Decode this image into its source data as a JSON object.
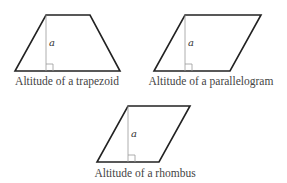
{
  "figures": [
    {
      "name": "trapezoid",
      "caption": "Altitude of a trapezoid",
      "altitude_label": "a",
      "vertices": [
        [
          46,
          15
        ],
        [
          90,
          15
        ],
        [
          120,
          71
        ],
        [
          15,
          71
        ]
      ],
      "altitude": {
        "x": 46,
        "y1": 15,
        "y2": 71
      },
      "label_pos": [
        49,
        46
      ],
      "caption_pos": [
        67,
        85
      ]
    },
    {
      "name": "parallelogram",
      "caption": "Altitude of a parallelogram",
      "altitude_label": "a",
      "vertices": [
        [
          185,
          15
        ],
        [
          261,
          15
        ],
        [
          230,
          71
        ],
        [
          154,
          71
        ]
      ],
      "altitude": {
        "x": 185,
        "y1": 15,
        "y2": 71
      },
      "label_pos": [
        188,
        46
      ],
      "caption_pos": [
        211,
        85
      ]
    },
    {
      "name": "rhombus",
      "caption": "Altitude of a rhombus",
      "altitude_label": "a",
      "vertices": [
        [
          128,
          106
        ],
        [
          190,
          106
        ],
        [
          159,
          162
        ],
        [
          97,
          162
        ]
      ],
      "altitude": {
        "x": 128,
        "y1": 106,
        "y2": 162
      },
      "label_pos": [
        131,
        137
      ],
      "caption_pos": [
        145,
        177
      ]
    }
  ],
  "colors": {
    "outline": "#222222",
    "altitude": "#9a9a9a",
    "caption_text": "#444444"
  }
}
